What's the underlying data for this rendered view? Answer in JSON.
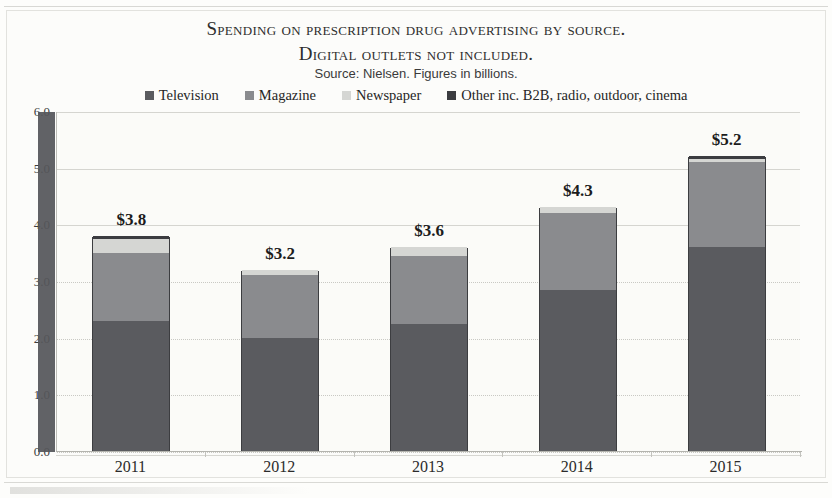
{
  "chart_data": {
    "type": "bar",
    "subtype": "stacked-column",
    "title": "Spending on prescription drug advertising by source.",
    "title_line2": "Digital outlets not included.",
    "subtitle": "Source: Nielsen. Figures in billions.",
    "xlabel": "",
    "ylabel": "",
    "categories": [
      "2011",
      "2012",
      "2013",
      "2014",
      "2015"
    ],
    "ylim": [
      0.0,
      6.0
    ],
    "ytick_labels": [
      "0.0",
      "1.0",
      "2.0",
      "3.0",
      "4.0",
      "5.0",
      "6.0"
    ],
    "ytick_values": [
      0.0,
      1.0,
      2.0,
      3.0,
      4.0,
      5.0,
      6.0
    ],
    "grid": true,
    "legend_position": "top",
    "series": [
      {
        "name": "Television",
        "color": "#5a5b5f",
        "values": [
          2.3,
          2.0,
          2.25,
          2.85,
          3.6
        ]
      },
      {
        "name": "Magazine",
        "color": "#8a8b8e",
        "values": [
          1.2,
          1.1,
          1.2,
          1.35,
          1.5
        ]
      },
      {
        "name": "Newspaper",
        "color": "#d5d6d3",
        "values": [
          0.25,
          0.1,
          0.15,
          0.1,
          0.05
        ]
      },
      {
        "name": "Other inc. B2B, radio, outdoor, cinema",
        "color": "#3b3c40",
        "values": [
          0.05,
          0.0,
          0.0,
          0.0,
          0.05
        ]
      }
    ],
    "totals_labels": [
      "$3.8",
      "$3.2",
      "$3.6",
      "$4.3",
      "$5.2"
    ],
    "totals": [
      3.8,
      3.2,
      3.6,
      4.3,
      5.2
    ]
  },
  "colors": {
    "television": "#5a5b5f",
    "magazine": "#8a8b8e",
    "newspaper": "#d5d6d3",
    "other": "#3b3c40",
    "plot_background": "#fbfbf8",
    "gridline": "#c9c9c4",
    "axis": "#b4b4ae",
    "text": "#2b2b2b"
  }
}
